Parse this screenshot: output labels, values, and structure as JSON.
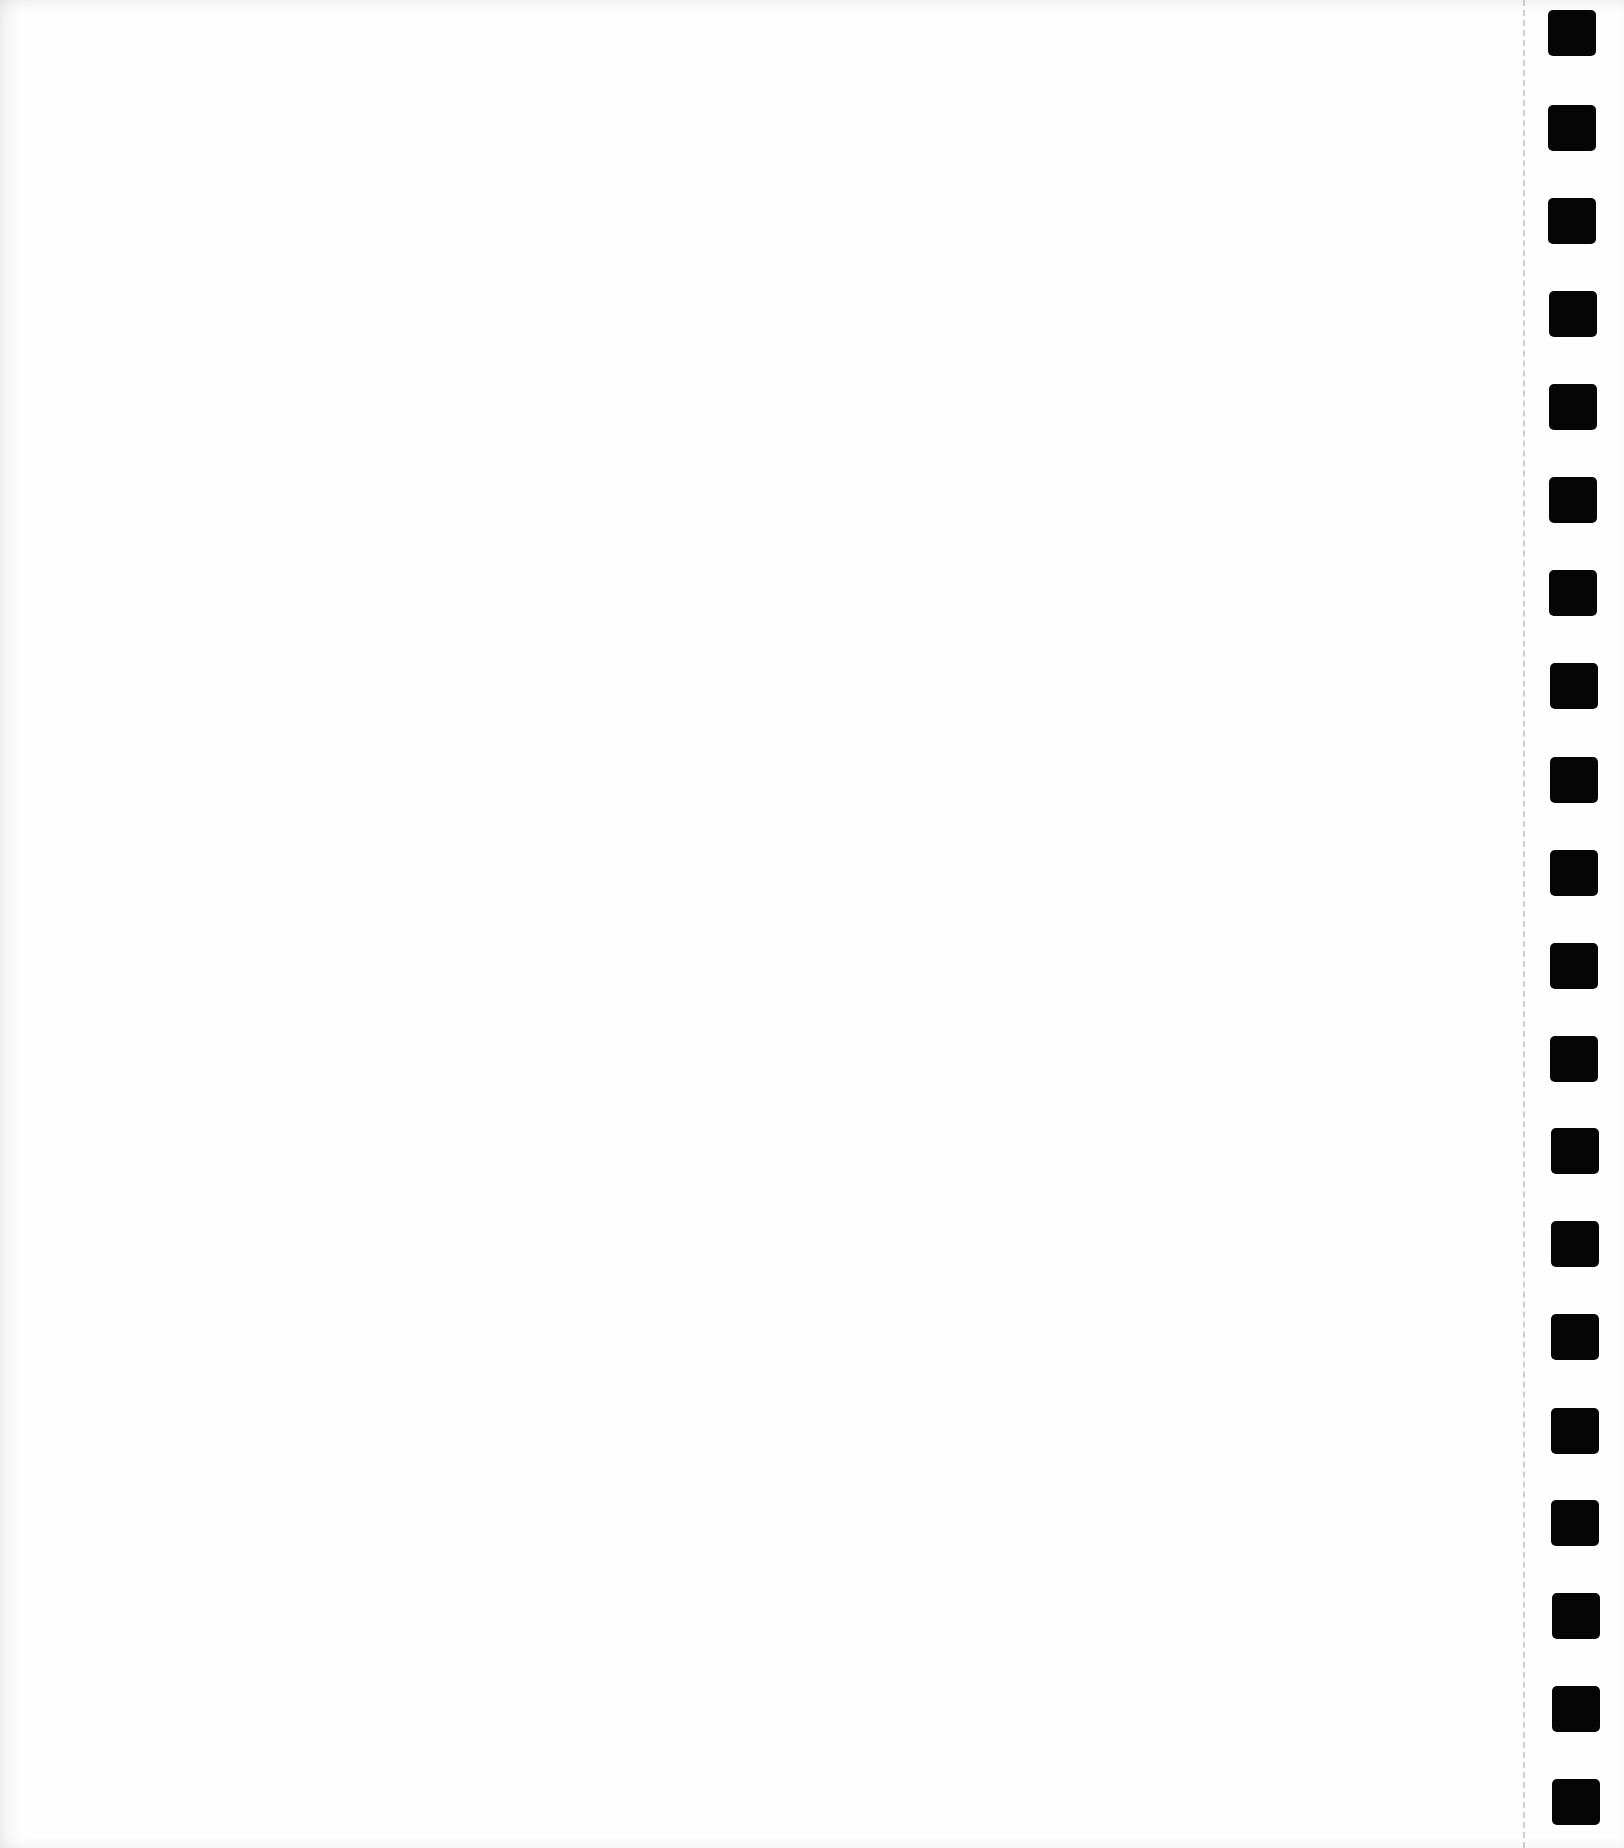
{
  "document": {
    "type": "scanned-form-page",
    "content": "blank",
    "background_color": "#fefefe"
  },
  "timing_marks": {
    "count": 20,
    "color": "#050505",
    "x_left": 1548,
    "width": 48,
    "height": 46,
    "positions_y": [
      10,
      105,
      198,
      291,
      384,
      477,
      570,
      663,
      757,
      850,
      943,
      1036,
      1128,
      1221,
      1314,
      1408,
      1500,
      1593,
      1686,
      1779
    ],
    "x_offsets": [
      0,
      0,
      0,
      1,
      1,
      1,
      1,
      2,
      2,
      2,
      2,
      2,
      3,
      3,
      3,
      3,
      3,
      4,
      4,
      4
    ]
  },
  "guide_line": {
    "style": "dashed",
    "x": 1523
  }
}
